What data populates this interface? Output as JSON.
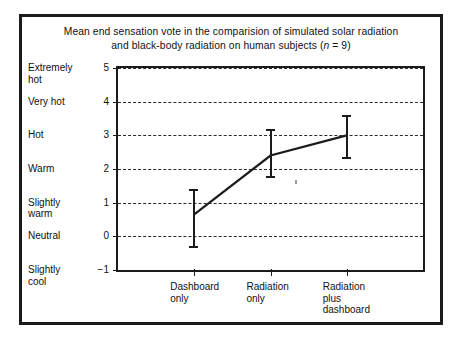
{
  "figure": {
    "title_line1": "Mean end  sensation  vote in the comparision of simulated solar radiation",
    "title_line2_a": "and black-body radiation on human subjects (",
    "title_line2_n": "n",
    "title_line2_b": " = 9)"
  },
  "chart_data": {
    "type": "line",
    "title": "Mean end sensation vote in the comparision of simulated solar radiation and black-body radiation on human subjects (n = 9)",
    "xlabel": "",
    "ylabel": "",
    "ylim": [
      -1,
      5
    ],
    "grid": true,
    "legend": "none",
    "categories": [
      "Dashboard only",
      "Radiation only",
      "Radiation plus dashboard"
    ],
    "category_lines": [
      [
        "Dashboard",
        "only"
      ],
      [
        "Radiation",
        "only"
      ],
      [
        "Radiation",
        "plus",
        "dashboard"
      ]
    ],
    "values": [
      0.65,
      2.4,
      3.0
    ],
    "error_low": [
      -0.3,
      1.8,
      2.35
    ],
    "error_high": [
      1.4,
      3.2,
      3.6
    ],
    "yticks": [
      5,
      4,
      3,
      2,
      1,
      0,
      -1
    ],
    "ytick_labels": [
      "5",
      "4",
      "3",
      "2",
      "1",
      "0",
      "−1"
    ],
    "ytick_words": [
      [
        "Extremely",
        "hot"
      ],
      [
        "Very hot"
      ],
      [
        "Hot"
      ],
      [
        "Warm"
      ],
      [
        "Slightly",
        "warm"
      ],
      [
        "Neutral"
      ],
      [
        "Slightly",
        "cool"
      ]
    ],
    "series": [
      {
        "name": "Mean end sensation vote",
        "values": [
          0.65,
          2.4,
          3.0
        ]
      }
    ],
    "colors": {
      "line": "#1b1b1b",
      "grid": "#2a2a2a",
      "frame": "#1b1b1b",
      "background": "#ffffff"
    }
  }
}
